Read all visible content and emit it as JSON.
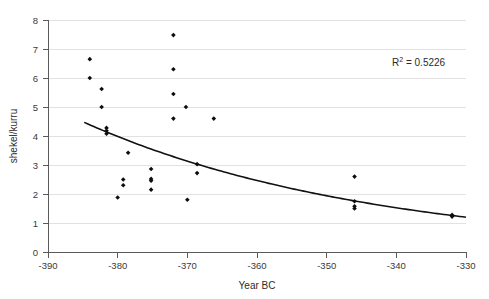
{
  "chart_data": {
    "type": "scatter",
    "title": "",
    "xlabel": "Year BC",
    "ylabel": "shekel/kurru",
    "xlim": [
      -390,
      -330
    ],
    "ylim": [
      0,
      8
    ],
    "xticks": [
      -390,
      -380,
      -370,
      -360,
      -350,
      -340,
      -330
    ],
    "xtick_labels": [
      "-390",
      "-380",
      "-370",
      "-360",
      "-350",
      "-340",
      "-330"
    ],
    "yticks": [
      0,
      1,
      2,
      3,
      4,
      5,
      6,
      7,
      8
    ],
    "ytick_labels": [
      "0",
      "1",
      "2",
      "3",
      "4",
      "5",
      "6",
      "7",
      "8"
    ],
    "grid": "horizontal",
    "legend": "none",
    "marker": "filled-diamond",
    "marker_color": "#0d0d0d",
    "points": [
      {
        "x": -384.0,
        "y": 6.65
      },
      {
        "x": -384.0,
        "y": 6.0
      },
      {
        "x": -382.3,
        "y": 5.62
      },
      {
        "x": -382.3,
        "y": 5.0
      },
      {
        "x": -381.6,
        "y": 4.28
      },
      {
        "x": -381.6,
        "y": 4.18
      },
      {
        "x": -381.6,
        "y": 4.08
      },
      {
        "x": -380.0,
        "y": 1.88
      },
      {
        "x": -379.2,
        "y": 2.5
      },
      {
        "x": -379.2,
        "y": 2.3
      },
      {
        "x": -378.5,
        "y": 3.42
      },
      {
        "x": -375.2,
        "y": 2.86
      },
      {
        "x": -375.2,
        "y": 2.52
      },
      {
        "x": -375.2,
        "y": 2.46
      },
      {
        "x": -375.2,
        "y": 2.15
      },
      {
        "x": -372.0,
        "y": 7.48
      },
      {
        "x": -372.0,
        "y": 6.3
      },
      {
        "x": -372.0,
        "y": 5.45
      },
      {
        "x": -372.0,
        "y": 4.6
      },
      {
        "x": -370.2,
        "y": 5.0
      },
      {
        "x": -370.0,
        "y": 1.8
      },
      {
        "x": -368.6,
        "y": 3.03
      },
      {
        "x": -368.6,
        "y": 2.72
      },
      {
        "x": -366.2,
        "y": 4.6
      },
      {
        "x": -346.0,
        "y": 2.6
      },
      {
        "x": -346.0,
        "y": 1.75
      },
      {
        "x": -346.0,
        "y": 1.58
      },
      {
        "x": -346.0,
        "y": 1.5
      },
      {
        "x": -332.0,
        "y": 1.28
      },
      {
        "x": -332.0,
        "y": 1.22
      }
    ],
    "trendline": {
      "type": "exponential-decay",
      "visible": true,
      "x_start": -384.8,
      "x_end": -330.0,
      "y_start": 4.47,
      "y_end": 1.2,
      "color": "#111111"
    },
    "annotations": [
      {
        "name": "r-squared",
        "prefix": "R",
        "sup": "2",
        "text": " = 0.5226"
      }
    ]
  }
}
